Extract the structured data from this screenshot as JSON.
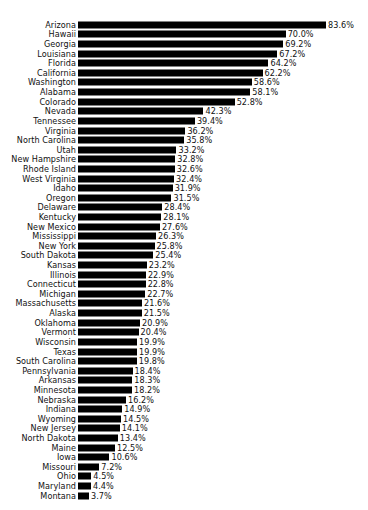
{
  "chart_data": {
    "type": "bar",
    "orientation": "horizontal",
    "title": "",
    "subtitle": "",
    "xlabel": "",
    "ylabel": "",
    "grid": false,
    "legend": false,
    "legend_position": "none",
    "value_suffix": "%",
    "xlim": [
      0,
      83.6
    ],
    "bar_color": "#000000",
    "background_color": "#ffffff",
    "text_color": "#111111",
    "sort": "descending",
    "categories": [
      "Arizona",
      "Hawaii",
      "Georgia",
      "Louisiana",
      "Florida",
      "California",
      "Washington",
      "Alabama",
      "Colorado",
      "Nevada",
      "Tennessee",
      "Virginia",
      "North Carolina",
      "Utah",
      "New Hampshire",
      "Rhode Island",
      "West Virginia",
      "Idaho",
      "Oregon",
      "Delaware",
      "Kentucky",
      "New Mexico",
      "Mississippi",
      "New York",
      "South Dakota",
      "Kansas",
      "Illinois",
      "Connecticut",
      "Michigan",
      "Massachusetts",
      "Alaska",
      "Oklahoma",
      "Vermont",
      "Wisconsin",
      "Texas",
      "South Carolina",
      "Pennsylvania",
      "Arkansas",
      "Minnesota",
      "Nebraska",
      "Indiana",
      "Wyoming",
      "New Jersey",
      "North Dakota",
      "Maine",
      "Iowa",
      "Missouri",
      "Ohio",
      "Maryland",
      "Montana"
    ],
    "values": [
      83.6,
      70.0,
      69.2,
      67.2,
      64.2,
      62.2,
      58.6,
      58.1,
      52.8,
      42.3,
      39.4,
      36.2,
      35.8,
      33.2,
      32.8,
      32.6,
      32.4,
      31.9,
      31.5,
      28.4,
      28.1,
      27.6,
      26.3,
      25.8,
      25.4,
      23.2,
      22.9,
      22.8,
      22.7,
      21.6,
      21.5,
      20.9,
      20.4,
      19.9,
      19.9,
      19.8,
      18.4,
      18.3,
      18.2,
      16.2,
      14.9,
      14.5,
      14.1,
      13.4,
      12.5,
      10.6,
      7.2,
      4.5,
      4.4,
      3.7
    ],
    "value_labels": [
      "83.6%",
      "70.0%",
      "69.2%",
      "67.2%",
      "64.2%",
      "62.2%",
      "58.6%",
      "58.1%",
      "52.8%",
      "42.3%",
      "39.4%",
      "36.2%",
      "35.8%",
      "33.2%",
      "32.8%",
      "32.6%",
      "32.4%",
      "31.9%",
      "31.5%",
      "28.4%",
      "28.1%",
      "27.6%",
      "26.3%",
      "25.8%",
      "25.4%",
      "23.2%",
      "22.9%",
      "22.8%",
      "22.7%",
      "21.6%",
      "21.5%",
      "20.9%",
      "20.4%",
      "19.9%",
      "19.9%",
      "19.8%",
      "18.4%",
      "18.3%",
      "18.2%",
      "16.2%",
      "14.9%",
      "14.5%",
      "14.1%",
      "13.4%",
      "12.5%",
      "10.6%",
      "7.2%",
      "4.5%",
      "4.4%",
      "3.7%"
    ]
  }
}
